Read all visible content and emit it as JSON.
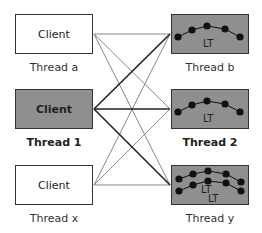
{
  "left": [
    {
      "label": "Client",
      "caption": "Thread a",
      "style": "white",
      "bold": false
    },
    {
      "label": "Client",
      "caption": "Thread 1",
      "style": "gray",
      "bold": true
    },
    {
      "label": "Client",
      "caption": "Thread x",
      "style": "white",
      "bold": false
    }
  ],
  "right": [
    {
      "label": "LT",
      "caption": "Thread b",
      "bold": false
    },
    {
      "label": "LT",
      "caption": "Thread 2",
      "bold": true
    },
    {
      "label": "LT",
      "label2": "LT",
      "caption": "Thread y",
      "bold": false
    }
  ],
  "colors": {
    "box_gray": "#8f8f8f",
    "border": "#333333",
    "line_thin": "#777777",
    "line_thick": "#222222",
    "node": "#111111"
  }
}
